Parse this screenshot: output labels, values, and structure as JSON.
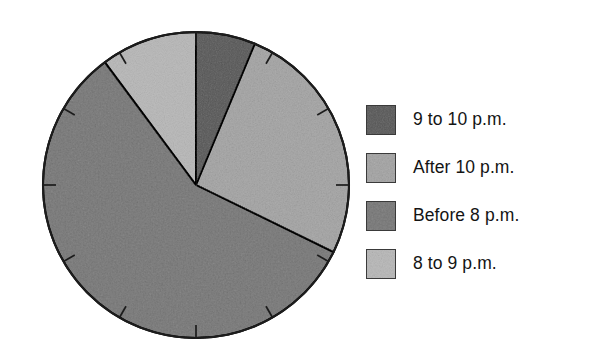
{
  "chart_data": {
    "type": "pie",
    "title": "",
    "xlabel": "",
    "ylabel": "",
    "grid": false,
    "legend_position": "right",
    "start_angle_deg": 0,
    "direction": "clockwise",
    "tick_marks": {
      "present": true,
      "count": 12,
      "interval_deg": 30,
      "description": "clock-style tick marks on circle rim"
    },
    "categories": [
      "9 to 10 p.m.",
      "After 10 p.m.",
      "Before 8 p.m.",
      "8 to 9 p.m."
    ],
    "values": [
      6,
      26,
      58,
      10
    ],
    "units": "percent",
    "slices": [
      {
        "label": "9 to 10 p.m.",
        "value": 6,
        "start_deg": 0,
        "end_deg": 22.6,
        "color": "#9a9a9a",
        "shade": "medium-dark-mottled"
      },
      {
        "label": "After 10 p.m.",
        "value": 26,
        "start_deg": 22.6,
        "end_deg": 116,
        "color": "#cfcfcf",
        "shade": "light"
      },
      {
        "label": "Before 8 p.m.",
        "value": 58,
        "start_deg": 116,
        "end_deg": 323.4,
        "color": "#b2b2b2",
        "shade": "medium"
      },
      {
        "label": "8 to 9 p.m.",
        "value": 10,
        "start_deg": 323.4,
        "end_deg": 360,
        "color": "#dadada",
        "shade": "lightest"
      }
    ],
    "colors": [
      "#9a9a9a",
      "#cfcfcf",
      "#b2b2b2",
      "#dadada"
    ],
    "outline_color": "#1c1c1c",
    "background": "#ffffff"
  },
  "legend": {
    "items": [
      {
        "label": "9 to 10 p.m.",
        "color": "#9a9a9a"
      },
      {
        "label": "After 10 p.m.",
        "color": "#cfcfcf"
      },
      {
        "label": "Before 8 p.m.",
        "color": "#b2b2b2"
      },
      {
        "label": "8 to 9 p.m.",
        "color": "#dadada"
      }
    ]
  }
}
